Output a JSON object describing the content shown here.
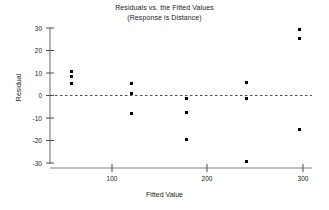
{
  "chart_data": {
    "type": "scatter",
    "title": "Residuals vs. the Fitted Values",
    "subtitle": "(Response is Distance)",
    "xlabel": "Fitted Value",
    "ylabel": "Residual",
    "xlim": [
      45,
      315
    ],
    "ylim": [
      -33,
      32
    ],
    "xticks": [
      100,
      200,
      300
    ],
    "xtick_labels": [
      "100",
      "200",
      "300"
    ],
    "yticks": [
      30,
      20,
      10,
      0,
      -10,
      -20,
      -30
    ],
    "ytick_labels": [
      "30",
      "20",
      "10",
      "0",
      "-10",
      "-20",
      "-30"
    ],
    "grid": false,
    "legend": null,
    "reference_line": {
      "orientation": "horizontal",
      "value": 0,
      "style": "dashed"
    },
    "marker": {
      "shape": "square",
      "color": "#000000",
      "size": 3
    },
    "points": [
      {
        "x": 58,
        "y": 10.5
      },
      {
        "x": 58,
        "y": 8.5
      },
      {
        "x": 58,
        "y": 5.5
      },
      {
        "x": 120,
        "y": 5.5
      },
      {
        "x": 120,
        "y": 0.8
      },
      {
        "x": 120,
        "y": -8.0
      },
      {
        "x": 178,
        "y": -1.5
      },
      {
        "x": 178,
        "y": -7.5
      },
      {
        "x": 178,
        "y": -19.5
      },
      {
        "x": 241,
        "y": 6.0
      },
      {
        "x": 241,
        "y": -1.5
      },
      {
        "x": 241,
        "y": -29.5
      },
      {
        "x": 296,
        "y": 29.5
      },
      {
        "x": 296,
        "y": 25.5
      },
      {
        "x": 296,
        "y": -15.0
      }
    ]
  },
  "axis_colors": {
    "line": "#808080",
    "tick": "#4d4d4d",
    "reference": "#4d4d4d",
    "text": "#1a1a1a"
  }
}
